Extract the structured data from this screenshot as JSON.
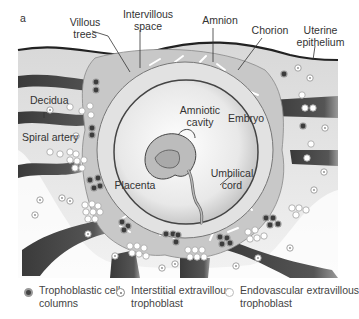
{
  "figure": {
    "panel_label": "a",
    "labels": {
      "villous_trees": "Villous\ntrees",
      "intervillous_space": "Intervillous\nspace",
      "amnion": "Amnion",
      "chorion": "Chorion",
      "uterine_epithelium": "Uterine\nepithelium",
      "decidua": "Decidua",
      "spiral_artery": "Spiral artery",
      "amniotic_cavity": "Amniotic\ncavity",
      "embryo": "Embryo",
      "placenta": "Placenta",
      "umbilical_cord": "Umbilical\ncord"
    },
    "legend": [
      {
        "symbol": "trophoblastic-cell-column-icon",
        "label": "Trophoblastic cell\ncolumns"
      },
      {
        "symbol": "interstitial-trophoblast-icon",
        "label": "Interstitial extravillous\ntrophoblast"
      },
      {
        "symbol": "endovascular-trophoblast-icon",
        "label": "Endovascular extravillous\ntrophoblast"
      }
    ],
    "colors": {
      "decidua_bg": "#e6e6e6",
      "placenta_fill": "#c9c9c9",
      "artery": "#4a4a4a",
      "villi": "#ffffff",
      "outline": "#222222"
    }
  }
}
